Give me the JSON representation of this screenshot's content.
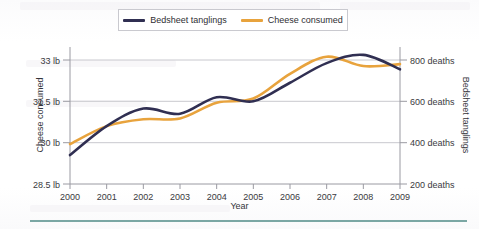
{
  "figure": {
    "xlabel": "Year",
    "ylabel_left": "Cheese consumed",
    "ylabel_right": "Bedsheet tanglings"
  },
  "legend": {
    "items": [
      {
        "label": "Bedsheet tanglings",
        "color": "#302f52",
        "icon": "line-swatch-icon"
      },
      {
        "label": "Cheese consumed",
        "color": "#e8a33d",
        "icon": "line-swatch-icon"
      }
    ]
  },
  "axis_left": {
    "ticks": [
      "33 lb",
      "31.5 lb",
      "30 lb",
      "28.5 lb"
    ],
    "values": [
      33,
      31.5,
      30,
      28.5
    ]
  },
  "axis_right": {
    "ticks": [
      "800 deaths",
      "600 deaths",
      "400 deaths",
      "200 deaths"
    ],
    "values": [
      800,
      600,
      400,
      200
    ]
  },
  "axis_x": {
    "ticks": [
      "2000",
      "2001",
      "2002",
      "2003",
      "2004",
      "2005",
      "2006",
      "2007",
      "2008",
      "2009"
    ]
  },
  "colors": {
    "bedsheet_navy": "#302f52",
    "cheese_orange": "#e8a33d",
    "gridline": "#c8c8ce",
    "axis": "#9a9aa2",
    "rule_teal": "#7ba7a4",
    "text": "#34343a"
  },
  "chart_data": {
    "type": "line",
    "title": "",
    "subtitle": "",
    "xlabel": "Year",
    "grid": true,
    "legend_position": "top-center",
    "x": [
      2000,
      2001,
      2002,
      2003,
      2004,
      2005,
      2006,
      2007,
      2008,
      2009
    ],
    "xticklabels": [
      "2000",
      "2001",
      "2002",
      "2003",
      "2004",
      "2005",
      "2006",
      "2007",
      "2008",
      "2009"
    ],
    "xlim": [
      2000,
      2009
    ],
    "axes": [
      {
        "id": "left",
        "label": "Cheese consumed",
        "unit": "lb",
        "ylim": [
          28.5,
          33.5
        ],
        "ticks": [
          28.5,
          30,
          31.5,
          33
        ],
        "ticklabels": [
          "28.5 lb",
          "30 lb",
          "31.5 lb",
          "33 lb"
        ]
      },
      {
        "id": "right",
        "label": "Bedsheet tanglings",
        "unit": "deaths",
        "ylim": [
          200,
          900
        ],
        "ticks": [
          200,
          400,
          600,
          800
        ],
        "ticklabels": [
          "200 deaths",
          "400 deaths",
          "600 deaths",
          "800 deaths"
        ]
      }
    ],
    "series": [
      {
        "name": "Cheese consumed",
        "axis": "left",
        "unit": "lb",
        "color": "#e8a33d",
        "values": [
          29.95,
          30.6,
          30.85,
          30.88,
          31.45,
          31.6,
          32.5,
          33.12,
          32.78,
          32.85
        ]
      },
      {
        "name": "Bedsheet tanglings",
        "axis": "right",
        "unit": "deaths",
        "color": "#302f52",
        "values": [
          340,
          480,
          565,
          540,
          620,
          600,
          690,
          785,
          825,
          755
        ]
      }
    ],
    "annotations": []
  }
}
